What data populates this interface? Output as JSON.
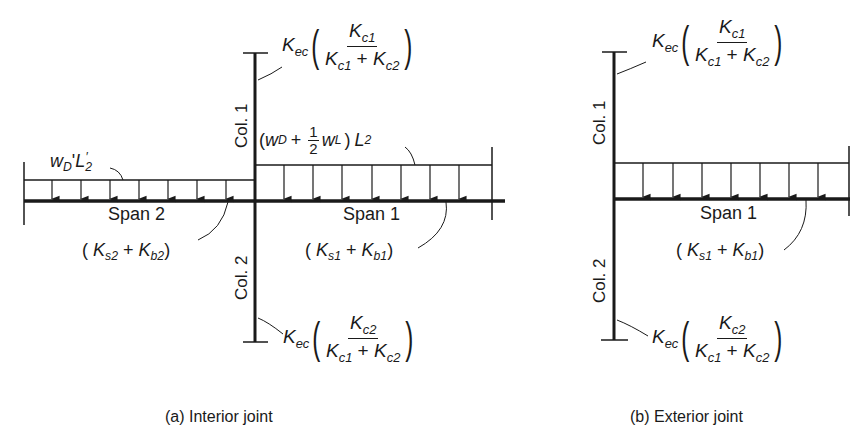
{
  "figure": {
    "panel_a": {
      "caption": "(a)  Interior joint",
      "col1_label": "Col. 1",
      "col2_label": "Col. 2",
      "span1_label": "Span 1",
      "span2_label": "Span 2",
      "span1_stiffness": {
        "open": "(",
        "k1": "K",
        "k1_sub": "s1",
        "plus": "+",
        "k2": "K",
        "k2_sub": "b1",
        "close": ")"
      },
      "span2_stiffness": {
        "open": "(",
        "k1": "K",
        "k1_sub": "s2",
        "plus": "+",
        "k2": "K",
        "k2_sub": "b2",
        "close": ")"
      },
      "load_span2": {
        "w": "w",
        "w_sub": "D",
        "prime1": "'",
        "L": "L",
        "L_sub": "2",
        "L_sup": "′"
      },
      "load_span1": {
        "open": "(",
        "w": "w",
        "w_sub": "D",
        "plus": "+",
        "frac_num": "1",
        "frac_den": "2",
        "wl": "w",
        "wl_sub": "L",
        "close": ")",
        "L": "L",
        "L_sub": "2"
      },
      "col1_dist": {
        "kec": "K",
        "kec_sub": "ec",
        "num": "K",
        "num_sub": "c1",
        "den_a": "K",
        "den_a_sub": "c1",
        "den_plus": "+",
        "den_b": "K",
        "den_b_sub": "c2"
      },
      "col2_dist": {
        "kec": "K",
        "kec_sub": "ec",
        "num": "K",
        "num_sub": "c2",
        "den_a": "K",
        "den_a_sub": "c1",
        "den_plus": "+",
        "den_b": "K",
        "den_b_sub": "c2"
      }
    },
    "panel_b": {
      "caption": "(b)  Exterior joint",
      "col1_label": "Col. 1",
      "col2_label": "Col. 2",
      "span1_label": "Span 1",
      "span1_stiffness": {
        "open": "(",
        "k1": "K",
        "k1_sub": "s1",
        "plus": "+",
        "k2": "K",
        "k2_sub": "b1",
        "close": ")"
      },
      "col1_dist": {
        "kec": "K",
        "kec_sub": "ec",
        "num": "K",
        "num_sub": "c1",
        "den_a": "K",
        "den_a_sub": "c1",
        "den_plus": "+",
        "den_b": "K",
        "den_b_sub": "c2"
      },
      "col2_dist": {
        "kec": "K",
        "kec_sub": "ec",
        "num": "K",
        "num_sub": "c2",
        "den_a": "K",
        "den_a_sub": "c1",
        "den_plus": "+",
        "den_b": "K",
        "den_b_sub": "c2"
      }
    },
    "colors": {
      "ink": "#1a1a1a",
      "background": "#ffffff"
    }
  }
}
